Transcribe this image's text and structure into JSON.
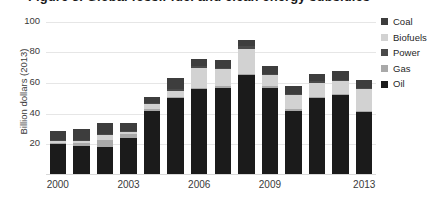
{
  "title": "Figure 3. Global fossil-fuel and clean energy subsidies",
  "chart_data": {
    "type": "bar",
    "title": "Figure 3. Global fossil-fuel and clean energy subsidies",
    "xlabel": "",
    "ylabel": "Billion dollars (2013)",
    "ylim": [
      0,
      105
    ],
    "yticks": [
      20,
      40,
      60,
      80,
      100
    ],
    "ytick_labels": [
      "20",
      "40",
      "60",
      "80",
      "100"
    ],
    "grid": true,
    "stacked": true,
    "legend_position": "right",
    "categories": [
      "2000",
      "2001",
      "2002",
      "2003",
      "2004",
      "2005",
      "2006",
      "2007",
      "2008",
      "2009",
      "2010",
      "2011",
      "2012",
      "2013"
    ],
    "xtick_labels": [
      "2000",
      "2003",
      "2006",
      "2009",
      "2013"
    ],
    "xtick_categories": [
      "2000",
      "2003",
      "2006",
      "2009",
      "2013"
    ],
    "stack_order_bottom_to_top": [
      "Oil",
      "Gas",
      "Biofuels",
      "Power",
      "Coal"
    ],
    "series": [
      {
        "name": "Oil",
        "color": "#1b1b1b",
        "values": [
          20,
          19,
          18,
          24,
          42,
          50,
          56,
          57,
          65,
          57,
          42,
          50,
          52,
          41
        ]
      },
      {
        "name": "Gas",
        "color": "#a9a9a9",
        "values": [
          1,
          2,
          5,
          3,
          1,
          1,
          1,
          1,
          1,
          1,
          1,
          1,
          1,
          1
        ]
      },
      {
        "name": "Biofuels",
        "color": "#d2d2d2",
        "values": [
          1,
          1,
          3,
          1,
          3,
          4,
          13,
          11,
          16,
          7,
          9,
          9,
          8,
          14
        ]
      },
      {
        "name": "Power",
        "color": "#4a4a4a",
        "values": [
          1,
          1,
          1,
          1,
          1,
          1,
          1,
          1,
          2,
          1,
          1,
          1,
          1,
          1
        ]
      },
      {
        "name": "Coal",
        "color": "#3d3d3d",
        "values": [
          6,
          7,
          7,
          5,
          4,
          7,
          5,
          5,
          4,
          5,
          5,
          5,
          6,
          5
        ]
      }
    ],
    "totals": [
      29,
      30,
      34,
      34,
      51,
      63,
      76,
      75,
      88,
      71,
      58,
      66,
      68,
      62
    ],
    "legend": [
      {
        "label": "Coal",
        "color": "#3d3d3d"
      },
      {
        "label": "Biofuels",
        "color": "#d2d2d2"
      },
      {
        "label": "Power",
        "color": "#4a4a4a"
      },
      {
        "label": "Gas",
        "color": "#a9a9a9"
      },
      {
        "label": "Oil",
        "color": "#1b1b1b"
      }
    ]
  },
  "axes": {
    "ylabel": "Billion dollars (2013)"
  }
}
